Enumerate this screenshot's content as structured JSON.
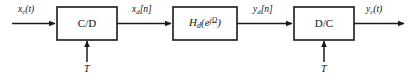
{
  "diagram": {
    "type": "block-diagram",
    "canvas": {
      "width": 411,
      "height": 82
    },
    "colors": {
      "background": "#ffffff",
      "stroke": "#1a1a1a",
      "text": "#111111",
      "block_fill": "#ffffff"
    },
    "blocks": [
      {
        "id": "cd",
        "label": "C/D",
        "label_plain": "C/D",
        "x": 57,
        "y": 7,
        "width": 60,
        "height": 33
      },
      {
        "id": "hd",
        "label": "Hd(e^{jΩ})",
        "label_base": "H",
        "label_sub": "d",
        "label_open": "(e",
        "label_sup": "jΩ",
        "label_close": ")",
        "x": 173,
        "y": 7,
        "width": 64,
        "height": 33
      },
      {
        "id": "dc",
        "label": "D/C",
        "label_plain": "D/C",
        "x": 294,
        "y": 7,
        "width": 60,
        "height": 33
      }
    ],
    "signals": [
      {
        "id": "xc",
        "text": "xc(t)",
        "base": "x",
        "sub": "c",
        "rest": "(t)",
        "x": 18,
        "y": 5,
        "description": "continuous-time input signal"
      },
      {
        "id": "xd",
        "text": "xd[n]",
        "base": "x",
        "sub": "d",
        "rest": "[n]",
        "x": 132,
        "y": 5,
        "description": "discrete-time signal after C/D conversion"
      },
      {
        "id": "yd",
        "text": "yd[n]",
        "base": "y",
        "sub": "d",
        "rest": "[n]",
        "x": 253,
        "y": 5,
        "description": "discrete-time signal after filtering"
      },
      {
        "id": "yc",
        "text": "yc(t)",
        "base": "y",
        "sub": "c",
        "rest": "(t)",
        "x": 366,
        "y": 5,
        "description": "continuous-time output signal"
      }
    ],
    "clocks": [
      {
        "id": "t-cd",
        "label": "T",
        "x": 84,
        "y": 66,
        "description": "sampling period into C/D"
      },
      {
        "id": "t-dc",
        "label": "T",
        "x": 321,
        "y": 66,
        "description": "sampling period into D/C"
      }
    ],
    "wires": [
      {
        "id": "in-to-cd",
        "from": "input-terminal",
        "to": "cd"
      },
      {
        "id": "cd-to-hd",
        "from": "cd",
        "to": "hd"
      },
      {
        "id": "hd-to-dc",
        "from": "hd",
        "to": "dc"
      },
      {
        "id": "dc-to-out",
        "from": "dc",
        "to": "output-terminal"
      },
      {
        "id": "t-into-cd",
        "from": "t-cd",
        "to": "cd"
      },
      {
        "id": "t-into-dc",
        "from": "t-dc",
        "to": "dc"
      }
    ]
  }
}
